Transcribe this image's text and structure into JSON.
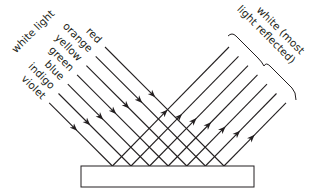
{
  "diagram": {
    "title_label": "white light",
    "incident_rays": [
      {
        "color_name": "red"
      },
      {
        "color_name": "orange"
      },
      {
        "color_name": "yellow"
      },
      {
        "color_name": "green"
      },
      {
        "color_name": "blue"
      },
      {
        "color_name": "indigo"
      },
      {
        "color_name": "violet"
      }
    ],
    "reflected_label_line1": "white (most",
    "reflected_label_line2": "light reflected)",
    "surface": "reflecting surface",
    "colors": {
      "line": "#231f20",
      "background": "#ffffff"
    }
  }
}
